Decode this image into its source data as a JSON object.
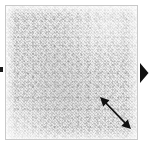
{
  "viewer": {
    "background_color": "#ffffff",
    "width": 150,
    "height": 146
  },
  "micrograph": {
    "label": "Micrograph panel",
    "caption": "",
    "border_color": "#c9c9c9",
    "background_color": "#efefef",
    "texture_description": "fine grainy granular greyscale texture",
    "tone_light": "#f6f6f6",
    "tone_mid": "#dcdcdc",
    "tone_dark": "#8c8c8c"
  },
  "annotations": {
    "scale_arrow": {
      "name": "double-headed diagonal arrow",
      "label": "",
      "color": "#111111",
      "direction": "upper-left to lower-right",
      "start": [
        101,
        98
      ],
      "end": [
        130,
        128
      ]
    },
    "edge_marker": {
      "name": "left edge marker",
      "label": "",
      "color": "#1a1a1a"
    }
  },
  "navigation": {
    "next": {
      "label": "",
      "icon": "play-triangle-right-icon",
      "color": "#111111"
    }
  }
}
